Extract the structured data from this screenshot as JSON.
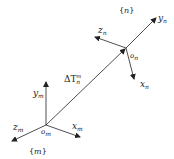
{
  "diagram": {
    "type": "coordinate-frame-transform",
    "frame_m": {
      "name": "{m}",
      "name_inner": "m",
      "origin_label": "o",
      "origin_sub": "m",
      "axes": {
        "x": {
          "label": "x",
          "sub": "m"
        },
        "y": {
          "label": "y",
          "sub": "m"
        },
        "z": {
          "label": "z",
          "sub": "m"
        }
      }
    },
    "frame_n": {
      "name": "{n}",
      "name_inner": "n",
      "origin_label": "o",
      "origin_sub": "n",
      "axes": {
        "x": {
          "label": "x",
          "sub": "n"
        },
        "y": {
          "label": "y",
          "sub": "n"
        },
        "z": {
          "label": "z",
          "sub": "n"
        }
      }
    },
    "transform": {
      "label": "ΔT",
      "sub": "n",
      "sup": "m"
    },
    "colors": {
      "line": "#222222",
      "background": "#ffffff"
    }
  }
}
